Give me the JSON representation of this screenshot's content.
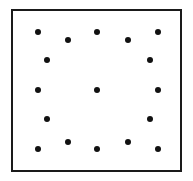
{
  "figure": {
    "canvas": {
      "width": 193,
      "height": 181,
      "background": "#ffffff"
    },
    "frame": {
      "name": "square-border",
      "x": 11,
      "y": 9,
      "width": 171,
      "height": 163,
      "border_width": 2,
      "border_color": "#1a1a1a",
      "fill_color": "#ffffff"
    },
    "dots": {
      "count": 16,
      "color": "#111111",
      "diameter": 6,
      "points": [
        {
          "id": "dot-1",
          "row": "top",
          "x": 38,
          "y": 32
        },
        {
          "id": "dot-2",
          "row": "top",
          "x": 68,
          "y": 40
        },
        {
          "id": "dot-3",
          "row": "top",
          "x": 97,
          "y": 32
        },
        {
          "id": "dot-4",
          "row": "top",
          "x": 128,
          "y": 40
        },
        {
          "id": "dot-5",
          "row": "top",
          "x": 158,
          "y": 32
        },
        {
          "id": "dot-6",
          "row": "upper-middle",
          "x": 47,
          "y": 60
        },
        {
          "id": "dot-7",
          "row": "upper-middle",
          "x": 150,
          "y": 60
        },
        {
          "id": "dot-8",
          "row": "middle",
          "x": 38,
          "y": 90
        },
        {
          "id": "dot-9",
          "row": "middle",
          "x": 97,
          "y": 90
        },
        {
          "id": "dot-10",
          "row": "middle",
          "x": 158,
          "y": 90
        },
        {
          "id": "dot-11",
          "row": "lower-middle",
          "x": 47,
          "y": 119
        },
        {
          "id": "dot-12",
          "row": "lower-middle",
          "x": 150,
          "y": 119
        },
        {
          "id": "dot-13",
          "row": "bottom",
          "x": 38,
          "y": 149
        },
        {
          "id": "dot-14",
          "row": "bottom",
          "x": 68,
          "y": 142
        },
        {
          "id": "dot-15",
          "row": "bottom",
          "x": 97,
          "y": 149
        },
        {
          "id": "dot-16",
          "row": "bottom",
          "x": 128,
          "y": 142
        },
        {
          "id": "dot-17",
          "row": "bottom",
          "x": 158,
          "y": 149
        }
      ]
    }
  },
  "chart_data": {
    "type": "scatter",
    "title": "",
    "xlabel": "",
    "ylabel": "",
    "xlim": [
      11,
      182
    ],
    "ylim": [
      9,
      172
    ],
    "grid": false,
    "legend": null,
    "marker": {
      "shape": "circle",
      "color": "#111111",
      "size": 6
    },
    "x": [
      38,
      68,
      97,
      128,
      158,
      47,
      150,
      38,
      97,
      158,
      47,
      150,
      38,
      68,
      97,
      128,
      158
    ],
    "y": [
      32,
      40,
      32,
      40,
      32,
      60,
      60,
      90,
      90,
      90,
      119,
      119,
      149,
      142,
      149,
      142,
      149
    ],
    "annotations": []
  }
}
